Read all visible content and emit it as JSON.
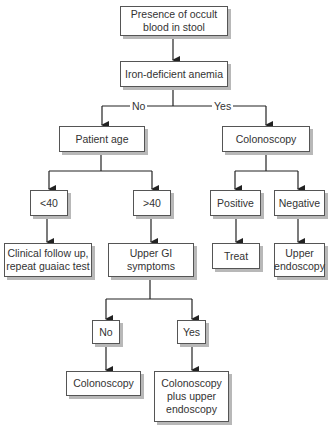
{
  "diagram": {
    "type": "flowchart",
    "nodes": {
      "start": "Presence of occult\nblood in stool",
      "iron": "Iron-deficient anemia",
      "age": "Patient age",
      "colonoscopy1": "Colonoscopy",
      "under40": "<40",
      "over40": ">40",
      "positive": "Positive",
      "negative": "Negative",
      "followup": "Clinical follow up,\nrepeat guaiac test",
      "upper_gi": "Upper GI\nsymptoms",
      "treat": "Treat",
      "upper_endo": "Upper\nendoscopy",
      "no": "No",
      "yes": "Yes",
      "colonoscopy2": "Colonoscopy",
      "colon_plus": "Colonoscopy\nplus upper\nendoscopy"
    },
    "edge_labels": {
      "no": "No",
      "yes": "Yes"
    }
  }
}
